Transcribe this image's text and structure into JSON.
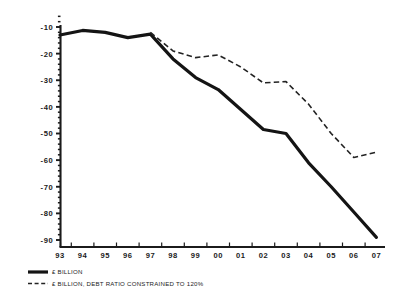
{
  "chart_data": {
    "type": "line",
    "title": "",
    "subtitle": "",
    "xlabel": "",
    "ylabel": "",
    "x": [
      "93",
      "94",
      "95",
      "96",
      "97",
      "98",
      "99",
      "00",
      "01",
      "02",
      "03",
      "04",
      "05",
      "06",
      "07"
    ],
    "xtick_labels": [
      "93",
      "94",
      "95",
      "96",
      "97",
      "98",
      "99",
      "00",
      "01",
      "02",
      "03",
      "04",
      "05",
      "06",
      "07"
    ],
    "ytick_labels": [
      "-10",
      "-20",
      "-30",
      "-40",
      "-50",
      "-60",
      "-70",
      "-80",
      "-90"
    ],
    "ytick_values": [
      -10,
      -20,
      -30,
      -40,
      -50,
      -60,
      -70,
      -80,
      -90
    ],
    "ylim": [
      -92,
      -8
    ],
    "grid": false,
    "legend_position": "below-left",
    "minor_ticks_per_interval": 5,
    "series": [
      {
        "name": "£ BILLION",
        "style": "solid",
        "color": "#141414",
        "x": [
          "93",
          "94",
          "95",
          "96",
          "97",
          "98",
          "99",
          "00",
          "01",
          "02",
          "03",
          "04",
          "05",
          "06",
          "07"
        ],
        "values": [
          -13.0,
          -11.3,
          -12.0,
          -14.0,
          -12.7,
          -22.0,
          -29.0,
          -33.5,
          -41.0,
          -48.5,
          -50.0,
          -61.0,
          -70.0,
          -79.5,
          -89.0
        ]
      },
      {
        "name": "£ BILLION, DEBT RATIO CONSTRAINED TO 120%",
        "style": "dashed",
        "color": "#232323",
        "x": [
          "97",
          "98",
          "99",
          "00",
          "01",
          "02",
          "03",
          "04",
          "05",
          "06",
          "07"
        ],
        "values": [
          -12.0,
          -19.0,
          -21.5,
          -20.5,
          -25.0,
          -31.0,
          -30.5,
          -39.0,
          -50.0,
          -59.0,
          -57.0
        ]
      }
    ],
    "legend": [
      {
        "label": "£ BILLION",
        "style": "solid"
      },
      {
        "label": "£ BILLION, DEBT RATIO CONSTRAINED TO 120%",
        "style": "dashed"
      }
    ]
  }
}
